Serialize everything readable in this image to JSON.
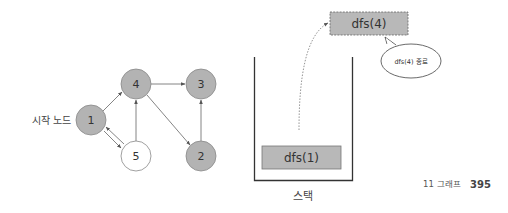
{
  "graph": {
    "start_label": "시작 노드",
    "nodes": [
      {
        "id": "1",
        "label": "1",
        "visited": true
      },
      {
        "id": "4",
        "label": "4",
        "visited": true
      },
      {
        "id": "3",
        "label": "3",
        "visited": true
      },
      {
        "id": "5",
        "label": "5",
        "visited": false
      },
      {
        "id": "2",
        "label": "2",
        "visited": true
      }
    ],
    "edges": [
      {
        "from": "1",
        "to": "4"
      },
      {
        "from": "1",
        "to": "5"
      },
      {
        "from": "5",
        "to": "1"
      },
      {
        "from": "5",
        "to": "4"
      },
      {
        "from": "4",
        "to": "3"
      },
      {
        "from": "4",
        "to": "2"
      },
      {
        "from": "2",
        "to": "3"
      }
    ]
  },
  "stack": {
    "label": "스택",
    "frames": [
      {
        "label": "dfs(1)"
      }
    ],
    "popped_frame": {
      "label": "dfs(4)"
    },
    "callout": "dfs(4) 종료"
  },
  "colors": {
    "visited_fill": "#b3b3b3",
    "unvisited_fill": "#ffffff",
    "frame_fill": "#b8b8b8",
    "edge": "#777777"
  },
  "footer": {
    "chapter": "11 그래프",
    "page": "395"
  }
}
